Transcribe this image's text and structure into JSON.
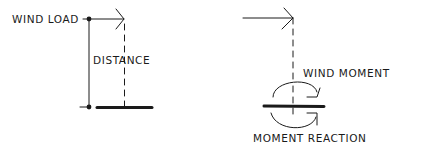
{
  "diagram": {
    "left_panel": {
      "wind_load_label": "WIND LOAD",
      "distance_label": "DISTANCE"
    },
    "right_panel": {
      "wind_moment_label": "WIND MOMENT",
      "moment_reaction_label": "MOMENT REACTION"
    },
    "colors": {
      "ink": "#1a1a1a",
      "background": "#ffffff"
    }
  }
}
